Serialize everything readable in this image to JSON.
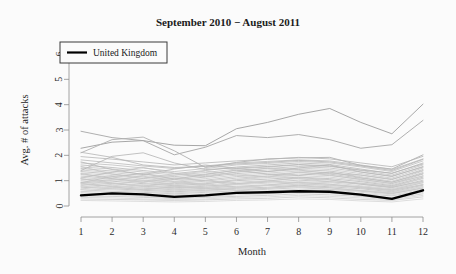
{
  "chart_data": {
    "type": "line",
    "title": "September 2010 − August 2011",
    "xlabel": "Month",
    "ylabel": "Avg. # of attacks",
    "xlim": [
      1,
      12
    ],
    "ylim": [
      0,
      6.4
    ],
    "grid": false,
    "x": [
      1,
      2,
      3,
      4,
      5,
      6,
      7,
      8,
      9,
      10,
      11,
      12
    ],
    "xticks": [
      "1",
      "2",
      "3",
      "4",
      "5",
      "6",
      "7",
      "8",
      "9",
      "10",
      "11",
      "12"
    ],
    "yticks": [
      "0",
      "1",
      "2",
      "3",
      "4",
      "5",
      "6"
    ],
    "ytick_values": [
      0,
      1,
      2,
      3,
      4,
      5,
      6
    ],
    "legend": {
      "position": "top-left",
      "entries": [
        {
          "label": "United Kingdom",
          "color": "#000000",
          "width": 2.2
        }
      ]
    },
    "highlight_color": "#000000",
    "background_color": "#fbfbfb",
    "series": [
      {
        "name": "United Kingdom",
        "highlight": true,
        "color": "#000000",
        "width": 2.4,
        "values": [
          0.42,
          0.5,
          0.46,
          0.36,
          0.42,
          0.52,
          0.54,
          0.58,
          0.56,
          0.45,
          0.28,
          0.62
        ]
      },
      {
        "name": "outlier-a",
        "highlight": false,
        "color": "#9d9d9d",
        "width": 0.9,
        "values": [
          2.28,
          2.52,
          2.58,
          2.4,
          2.38,
          3.05,
          3.3,
          3.62,
          3.85,
          3.3,
          2.85,
          4.02
        ]
      },
      {
        "name": "outlier-b",
        "highlight": false,
        "color": "#a6a6a6",
        "width": 0.9,
        "values": [
          2.95,
          2.7,
          2.58,
          2.02,
          2.32,
          2.78,
          2.7,
          2.82,
          2.62,
          2.28,
          2.42,
          3.38
        ]
      },
      {
        "name": "outlier-c",
        "highlight": false,
        "color": "#b0b0b0",
        "width": 0.9,
        "values": [
          2.1,
          2.62,
          2.72,
          2.18,
          1.52,
          1.72,
          1.86,
          1.9,
          1.92,
          1.6,
          1.46,
          2.02
        ]
      },
      {
        "name": "country-01",
        "highlight": false,
        "color": "#b5b5b5",
        "width": 0.8,
        "values": [
          1.95,
          1.85,
          1.74,
          1.62,
          1.7,
          1.78,
          1.84,
          1.92,
          1.86,
          1.7,
          1.55,
          1.96
        ]
      },
      {
        "name": "country-02",
        "highlight": false,
        "color": "#bababa",
        "width": 0.8,
        "values": [
          1.82,
          1.7,
          1.58,
          1.48,
          1.58,
          1.7,
          1.76,
          1.82,
          1.78,
          1.62,
          1.44,
          1.86
        ]
      },
      {
        "name": "country-03",
        "highlight": false,
        "color": "#bfbfbf",
        "width": 0.8,
        "values": [
          1.7,
          1.62,
          1.5,
          1.36,
          1.48,
          1.62,
          1.68,
          1.76,
          1.7,
          1.54,
          1.36,
          1.78
        ]
      },
      {
        "name": "country-04",
        "highlight": false,
        "color": "#b8b8b8",
        "width": 0.8,
        "values": [
          1.62,
          1.52,
          1.4,
          1.28,
          1.4,
          1.54,
          1.62,
          1.7,
          1.64,
          1.46,
          1.28,
          1.7
        ]
      },
      {
        "name": "country-05",
        "highlight": false,
        "color": "#c2c2c2",
        "width": 0.8,
        "values": [
          1.54,
          1.46,
          1.34,
          1.22,
          1.32,
          1.46,
          1.54,
          1.62,
          1.56,
          1.4,
          1.22,
          1.62
        ]
      },
      {
        "name": "country-06",
        "highlight": false,
        "color": "#bcbcbc",
        "width": 0.8,
        "values": [
          1.48,
          1.38,
          1.26,
          1.16,
          1.26,
          1.4,
          1.48,
          1.56,
          1.5,
          1.34,
          1.16,
          1.56
        ]
      },
      {
        "name": "country-07",
        "highlight": false,
        "color": "#c5c5c5",
        "width": 0.8,
        "values": [
          1.42,
          1.32,
          1.2,
          1.1,
          1.2,
          1.34,
          1.42,
          1.5,
          1.44,
          1.28,
          1.1,
          1.5
        ]
      },
      {
        "name": "country-08",
        "highlight": false,
        "color": "#b9b9b9",
        "width": 0.8,
        "values": [
          1.36,
          1.26,
          1.14,
          1.04,
          1.14,
          1.28,
          1.36,
          1.44,
          1.38,
          1.22,
          1.04,
          1.44
        ]
      },
      {
        "name": "country-09",
        "highlight": false,
        "color": "#c8c8c8",
        "width": 0.8,
        "values": [
          1.3,
          1.2,
          1.08,
          0.98,
          1.08,
          1.22,
          1.3,
          1.38,
          1.32,
          1.16,
          0.98,
          1.38
        ]
      },
      {
        "name": "country-10",
        "highlight": false,
        "color": "#bdbdbd",
        "width": 0.8,
        "values": [
          1.24,
          1.14,
          1.02,
          0.94,
          1.02,
          1.16,
          1.24,
          1.32,
          1.26,
          1.1,
          0.94,
          1.32
        ]
      },
      {
        "name": "country-11",
        "highlight": false,
        "color": "#c0c0c0",
        "width": 0.8,
        "values": [
          1.18,
          1.08,
          0.98,
          0.88,
          0.98,
          1.1,
          1.18,
          1.26,
          1.2,
          1.06,
          0.88,
          1.26
        ]
      },
      {
        "name": "country-12",
        "highlight": false,
        "color": "#cacaca",
        "width": 0.8,
        "values": [
          1.12,
          1.04,
          0.92,
          0.84,
          0.92,
          1.04,
          1.12,
          1.2,
          1.14,
          1.0,
          0.84,
          1.2
        ]
      },
      {
        "name": "country-13",
        "highlight": false,
        "color": "#b7b7b7",
        "width": 0.8,
        "values": [
          1.06,
          0.98,
          0.88,
          0.8,
          0.88,
          1.0,
          1.06,
          1.14,
          1.08,
          0.96,
          0.8,
          1.14
        ]
      },
      {
        "name": "country-14",
        "highlight": false,
        "color": "#c6c6c6",
        "width": 0.8,
        "values": [
          1.0,
          0.92,
          0.82,
          0.76,
          0.82,
          0.94,
          1.0,
          1.08,
          1.02,
          0.9,
          0.76,
          1.08
        ]
      },
      {
        "name": "country-15",
        "highlight": false,
        "color": "#bebebe",
        "width": 0.8,
        "values": [
          0.94,
          0.88,
          0.78,
          0.72,
          0.78,
          0.88,
          0.94,
          1.02,
          0.96,
          0.86,
          0.72,
          1.02
        ]
      },
      {
        "name": "country-16",
        "highlight": false,
        "color": "#cccccc",
        "width": 0.8,
        "values": [
          0.88,
          0.82,
          0.74,
          0.68,
          0.74,
          0.84,
          0.9,
          0.96,
          0.92,
          0.8,
          0.68,
          0.96
        ]
      },
      {
        "name": "country-17",
        "highlight": false,
        "color": "#c1c1c1",
        "width": 0.8,
        "values": [
          0.84,
          0.78,
          0.7,
          0.64,
          0.7,
          0.78,
          0.84,
          0.92,
          0.86,
          0.76,
          0.64,
          0.92
        ]
      },
      {
        "name": "country-18",
        "highlight": false,
        "color": "#c9c9c9",
        "width": 0.8,
        "values": [
          0.78,
          0.72,
          0.66,
          0.6,
          0.66,
          0.74,
          0.8,
          0.86,
          0.82,
          0.72,
          0.6,
          0.86
        ]
      },
      {
        "name": "country-19",
        "highlight": false,
        "color": "#bbbbbb",
        "width": 0.8,
        "values": [
          0.74,
          0.68,
          0.62,
          0.56,
          0.62,
          0.7,
          0.74,
          0.82,
          0.76,
          0.68,
          0.56,
          0.82
        ]
      },
      {
        "name": "country-20",
        "highlight": false,
        "color": "#cecece",
        "width": 0.8,
        "values": [
          0.68,
          0.64,
          0.58,
          0.52,
          0.58,
          0.66,
          0.7,
          0.76,
          0.72,
          0.62,
          0.52,
          0.76
        ]
      },
      {
        "name": "country-21",
        "highlight": false,
        "color": "#c3c3c3",
        "width": 0.8,
        "values": [
          0.64,
          0.58,
          0.54,
          0.48,
          0.54,
          0.6,
          0.66,
          0.72,
          0.66,
          0.58,
          0.48,
          0.72
        ]
      },
      {
        "name": "country-22",
        "highlight": false,
        "color": "#d0d0d0",
        "width": 0.8,
        "values": [
          0.58,
          0.54,
          0.48,
          0.44,
          0.48,
          0.56,
          0.6,
          0.66,
          0.62,
          0.54,
          0.44,
          0.66
        ]
      },
      {
        "name": "country-23",
        "highlight": false,
        "color": "#c4c4c4",
        "width": 0.8,
        "values": [
          0.52,
          0.48,
          0.44,
          0.4,
          0.44,
          0.5,
          0.54,
          0.6,
          0.56,
          0.48,
          0.4,
          0.6
        ]
      },
      {
        "name": "country-24",
        "highlight": false,
        "color": "#d2d2d2",
        "width": 0.8,
        "values": [
          0.46,
          0.44,
          0.38,
          0.34,
          0.38,
          0.44,
          0.48,
          0.54,
          0.5,
          0.42,
          0.34,
          0.54
        ]
      },
      {
        "name": "country-25",
        "highlight": false,
        "color": "#c7c7c7",
        "width": 0.8,
        "values": [
          0.4,
          0.38,
          0.34,
          0.3,
          0.34,
          0.38,
          0.42,
          0.48,
          0.44,
          0.38,
          0.3,
          0.48
        ]
      },
      {
        "name": "country-26",
        "highlight": false,
        "color": "#d4d4d4",
        "width": 0.8,
        "values": [
          0.34,
          0.32,
          0.28,
          0.26,
          0.28,
          0.34,
          0.36,
          0.42,
          0.38,
          0.32,
          0.26,
          0.42
        ]
      },
      {
        "name": "country-27",
        "highlight": false,
        "color": "#cbcbcb",
        "width": 0.8,
        "values": [
          0.28,
          0.26,
          0.24,
          0.22,
          0.24,
          0.28,
          0.3,
          0.36,
          0.32,
          0.26,
          0.22,
          0.36
        ]
      },
      {
        "name": "country-28",
        "highlight": false,
        "color": "#d6d6d6",
        "width": 0.8,
        "values": [
          0.22,
          0.2,
          0.18,
          0.16,
          0.18,
          0.22,
          0.24,
          0.28,
          0.26,
          0.2,
          0.16,
          0.28
        ]
      },
      {
        "name": "country-29",
        "highlight": false,
        "color": "#b4b4b4",
        "width": 0.8,
        "values": [
          2.12,
          1.92,
          1.62,
          1.52,
          1.56,
          1.66,
          1.72,
          1.8,
          1.74,
          1.58,
          1.4,
          1.84
        ]
      },
      {
        "name": "country-30",
        "highlight": false,
        "color": "#b2b2b2",
        "width": 0.8,
        "values": [
          1.4,
          1.96,
          2.1,
          1.7,
          1.44,
          1.5,
          1.56,
          1.64,
          1.58,
          1.42,
          1.3,
          1.66
        ]
      },
      {
        "name": "country-31",
        "highlight": false,
        "color": "#b6b6b6",
        "width": 0.8,
        "values": [
          1.74,
          1.44,
          1.24,
          1.46,
          1.62,
          1.48,
          1.36,
          1.5,
          1.62,
          1.34,
          1.18,
          1.54
        ]
      },
      {
        "name": "country-32",
        "highlight": false,
        "color": "#c0c0c0",
        "width": 0.8,
        "values": [
          1.1,
          1.34,
          1.52,
          1.3,
          1.16,
          1.34,
          1.5,
          1.42,
          1.28,
          1.22,
          1.06,
          1.4
        ]
      },
      {
        "name": "country-33",
        "highlight": false,
        "color": "#bdbdbd",
        "width": 0.8,
        "values": [
          0.92,
          1.16,
          1.28,
          1.06,
          1.24,
          1.42,
          1.26,
          1.2,
          1.34,
          1.12,
          0.94,
          1.28
        ]
      },
      {
        "name": "country-34",
        "highlight": false,
        "color": "#c5c5c5",
        "width": 0.8,
        "values": [
          1.56,
          1.26,
          1.08,
          1.22,
          1.38,
          1.22,
          1.14,
          1.34,
          1.22,
          1.04,
          0.9,
          1.18
        ]
      },
      {
        "name": "country-35",
        "highlight": false,
        "color": "#cacaca",
        "width": 0.8,
        "values": [
          0.8,
          1.02,
          1.18,
          0.96,
          0.86,
          1.04,
          1.18,
          1.08,
          0.96,
          0.9,
          0.78,
          1.1
        ]
      },
      {
        "name": "country-36",
        "highlight": false,
        "color": "#c2c2c2",
        "width": 0.8,
        "values": [
          1.28,
          1.08,
          0.94,
          1.1,
          1.0,
          0.88,
          0.98,
          1.12,
          1.04,
          0.86,
          0.74,
          0.98
        ]
      },
      {
        "name": "country-37",
        "highlight": false,
        "color": "#cdcdcd",
        "width": 0.8,
        "values": [
          0.66,
          0.86,
          1.0,
          0.82,
          0.72,
          0.86,
          0.98,
          0.9,
          0.8,
          0.76,
          0.64,
          0.92
        ]
      },
      {
        "name": "country-38",
        "highlight": false,
        "color": "#c8c8c8",
        "width": 0.8,
        "values": [
          1.08,
          0.9,
          0.78,
          0.92,
          0.84,
          0.74,
          0.82,
          0.94,
          0.86,
          0.72,
          0.62,
          0.84
        ]
      },
      {
        "name": "country-39",
        "highlight": false,
        "color": "#d1d1d1",
        "width": 0.8,
        "values": [
          0.56,
          0.72,
          0.84,
          0.68,
          0.6,
          0.72,
          0.82,
          0.76,
          0.66,
          0.62,
          0.54,
          0.78
        ]
      },
      {
        "name": "country-40",
        "highlight": false,
        "color": "#c6c6c6",
        "width": 0.8,
        "values": [
          0.9,
          0.76,
          0.64,
          0.76,
          0.7,
          0.62,
          0.7,
          0.8,
          0.72,
          0.6,
          0.5,
          0.7
        ]
      }
    ]
  }
}
